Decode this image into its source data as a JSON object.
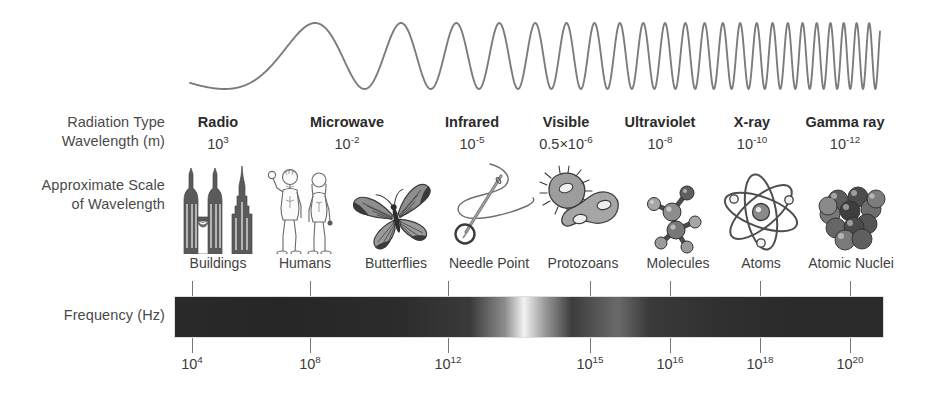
{
  "row_labels": {
    "radiation_type": "Radiation Type",
    "wavelength": "Wavelength (m)",
    "approximate_scale_line1": "Approximate Scale",
    "approximate_scale_line2": "of Wavelength",
    "frequency": "Frequency (Hz)"
  },
  "chart_data": {
    "type": "diagram",
    "orientation": "horizontal",
    "axis_direction": "increasing frequency / decreasing wavelength, left to right",
    "bands": [
      {
        "name": "Radio",
        "wavelength_label": "10",
        "wavelength_exponent": "3",
        "wavelength_m": 1000,
        "scale_object": "Buildings",
        "icon": "skyscrapers-icon",
        "x": 218
      },
      {
        "name": "Microwave",
        "wavelength_label": "10",
        "wavelength_exponent": "-2",
        "wavelength_m": 0.01,
        "scale_object": "Humans",
        "icon": "humans-icon",
        "x": 347
      },
      {
        "name": "Infrared",
        "wavelength_label": "10",
        "wavelength_exponent": "-5",
        "wavelength_m": 1e-05,
        "scale_object": "Butterflies",
        "icon": "butterfly-icon",
        "x": 472
      },
      {
        "name": "Visible",
        "wavelength_prefix": "0.5×10",
        "wavelength_exponent": "-6",
        "wavelength_m": 5e-07,
        "scale_object": "Needle Point",
        "icon": "needle-icon",
        "x": 566
      },
      {
        "name": "Ultraviolet",
        "wavelength_label": "10",
        "wavelength_exponent": "-8",
        "wavelength_m": 1e-08,
        "scale_object": "Protozoans",
        "icon": "protozoan-icon",
        "x": 660
      },
      {
        "name": "X-ray",
        "wavelength_label": "10",
        "wavelength_exponent": "-10",
        "wavelength_m": 1e-10,
        "scale_object": "Molecules",
        "icon": "molecule-icon",
        "x": 752
      },
      {
        "name": "Gamma ray",
        "wavelength_label": "10",
        "wavelength_exponent": "-12",
        "wavelength_m": 1e-12,
        "scale_object": "Atoms",
        "icon": "atom-icon",
        "x": 845
      }
    ],
    "scale_labels": [
      {
        "text": "Buildings",
        "x": 218
      },
      {
        "text": "Humans",
        "x": 305
      },
      {
        "text": "Butterflies",
        "x": 396
      },
      {
        "text": "Needle Point",
        "x": 489
      },
      {
        "text": "Protozoans",
        "x": 583
      },
      {
        "text": "Molecules",
        "x": 678
      },
      {
        "text": "Atoms",
        "x": 761
      },
      {
        "text": "Atomic Nuclei",
        "x": 851
      }
    ],
    "frequency_axis": {
      "label": "Frequency (Hz)",
      "unit": "Hz",
      "ticks": [
        {
          "mantissa": "10",
          "exponent": "4",
          "value": 10000.0,
          "x": 192
        },
        {
          "mantissa": "10",
          "exponent": "8",
          "value": 100000000.0,
          "x": 310
        },
        {
          "mantissa": "10",
          "exponent": "12",
          "value": 1000000000000.0,
          "x": 448
        },
        {
          "mantissa": "10",
          "exponent": "15",
          "value": 1000000000000000.0,
          "x": 590
        },
        {
          "mantissa": "10",
          "exponent": "16",
          "value": 1e+16,
          "x": 670
        },
        {
          "mantissa": "10",
          "exponent": "18",
          "value": 1e+18,
          "x": 760
        },
        {
          "mantissa": "10",
          "exponent": "20",
          "value": 1e+20,
          "x": 850
        }
      ]
    },
    "spectrum_bar": {
      "x_start": 174,
      "x_end": 884,
      "note": "grayscale spectrum strip; bright band at visible-light region",
      "visible_band_center_x": 524,
      "colors": {
        "dark": "#2a2a2a",
        "mid": "#4f4f4f",
        "bright": "#f2f2f2"
      }
    },
    "wave": {
      "note": "sinusoid with wavelength shrinking left to right",
      "x_start": 190,
      "x_end": 880,
      "color": "#7c7c7c",
      "amplitude_px": 33
    }
  },
  "colors": {
    "text": "#3a3a3a",
    "bold_text": "#2b2b2b",
    "tick": "#777777",
    "wave": "#7c7c7c",
    "background": "#ffffff"
  }
}
